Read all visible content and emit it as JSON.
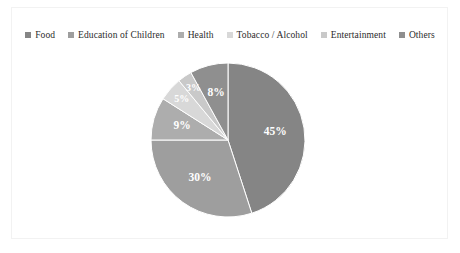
{
  "chart_data": {
    "type": "pie",
    "title": "",
    "categories": [
      "Food",
      "Education of Children",
      "Health",
      "Tobacco / Alcohol",
      "Entertainment",
      "Others"
    ],
    "values": [
      45,
      30,
      9,
      5,
      3,
      8
    ],
    "value_labels": [
      "45%",
      "30%",
      "9%",
      "5%",
      "3%",
      "8%"
    ],
    "colors": [
      "#858585",
      "#9e9e9e",
      "#adadad",
      "#d8d8d8",
      "#c9c9c9",
      "#8f8f8f"
    ],
    "unit": "%",
    "legend_position": "top",
    "grid": false,
    "start_angle_deg": 0,
    "direction": "clockwise"
  },
  "legend": {
    "items": [
      {
        "label": "Food",
        "color": "#858585",
        "marker": "square-swatch-icon"
      },
      {
        "label": "Education of Children",
        "color": "#9e9e9e",
        "marker": "square-swatch-icon"
      },
      {
        "label": "Health",
        "color": "#adadad",
        "marker": "square-swatch-icon"
      },
      {
        "label": "Tobacco / Alcohol",
        "color": "#d8d8d8",
        "marker": "square-swatch-icon"
      },
      {
        "label": "Entertainment",
        "color": "#c9c9c9",
        "marker": "square-swatch-icon"
      },
      {
        "label": "Others",
        "color": "#8f8f8f",
        "marker": "square-swatch-icon"
      }
    ]
  },
  "slice_labels": {
    "food": "45%",
    "education": "30%",
    "health": "9%",
    "tobacco": "5%",
    "entertainment": "3%",
    "others": "8%"
  }
}
